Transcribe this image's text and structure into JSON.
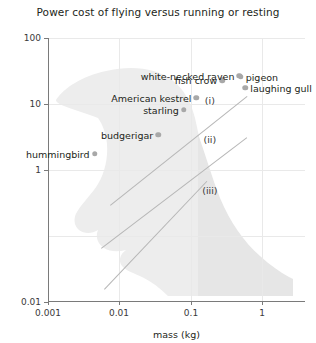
{
  "chart_data": {
    "type": "scatter",
    "title": "Power cost of flying versus running or resting",
    "xlabel": "mass (kg)",
    "ylabel": "power input (W)",
    "xscale": "log",
    "yscale": "log",
    "xlim": [
      0.001,
      3.0
    ],
    "ylim": [
      0.01,
      100
    ],
    "xticks": [
      "0.001",
      "0.01",
      "0.1",
      "1"
    ],
    "xtick_values": [
      0.001,
      0.01,
      0.1,
      1
    ],
    "yticks": [
      "100",
      "10",
      "1",
      "0.01"
    ],
    "ytick_values": [
      100,
      10,
      1,
      0.01
    ],
    "grid": "faint decade gridlines",
    "legend": "none",
    "background_watermark": "bird-silhouette",
    "points": [
      {
        "label": "hummingbird",
        "x": 0.0045,
        "y": 1.75,
        "label_side": "left"
      },
      {
        "label": "budgerigar",
        "x": 0.035,
        "y": 3.4,
        "label_side": "left"
      },
      {
        "label": "starling",
        "x": 0.08,
        "y": 8.2,
        "label_side": "left"
      },
      {
        "label": "American kestrel",
        "x": 0.12,
        "y": 12.5,
        "label_side": "left"
      },
      {
        "label": "fish crow",
        "x": 0.275,
        "y": 23.0,
        "label_side": "left"
      },
      {
        "label": "white-necked raven",
        "x": 0.48,
        "y": 27.0,
        "label_side": "left"
      },
      {
        "label": "pigeon",
        "x": 0.5,
        "y": 26.0,
        "label_side": "right"
      },
      {
        "label": "laughing gull",
        "x": 0.58,
        "y": 17.5,
        "label_side": "right"
      }
    ],
    "trend_lines": [
      {
        "name": "(i)",
        "x1": 0.0075,
        "y1": 0.3,
        "x2": 0.62,
        "y2": 13.5
      },
      {
        "name": "(ii)",
        "x1": 0.0055,
        "y1": 0.065,
        "x2": 0.6,
        "y2": 3.1
      },
      {
        "name": "(iii)",
        "x1": 0.006,
        "y1": 0.016,
        "x2": 0.165,
        "y2": 0.7
      }
    ],
    "line_labels": [
      {
        "text": "(i)",
        "x": 0.185,
        "y": 11.5
      },
      {
        "text": "(ii)",
        "x": 0.185,
        "y": 3.0
      },
      {
        "text": "(iii)",
        "x": 0.185,
        "y": 0.5
      }
    ]
  }
}
